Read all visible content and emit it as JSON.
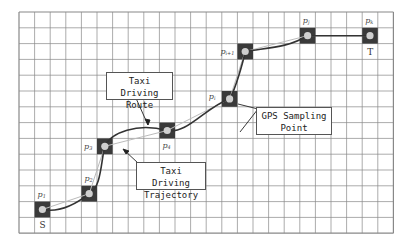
{
  "grid": {
    "left": 19,
    "top": 12,
    "cols": 24,
    "rows": 14,
    "cell_w": 15.6,
    "cell_h": 15.8,
    "line_color": "#888888"
  },
  "colors": {
    "cell_fill": "#3a3a3a",
    "point_fill": "#cfcfcf",
    "route_color": "#333333",
    "trajectory_color": "#bbbbbb"
  },
  "sampling_points": [
    {
      "id": "p1",
      "base": "p",
      "sub": "1",
      "col": 1,
      "row": 12
    },
    {
      "id": "p2",
      "base": "p",
      "sub": "2",
      "col": 4,
      "row": 11
    },
    {
      "id": "p3",
      "base": "p",
      "sub": "3",
      "col": 5,
      "row": 8
    },
    {
      "id": "p4",
      "base": "p",
      "sub": "4",
      "col": 9,
      "row": 7
    },
    {
      "id": "pi",
      "base": "p",
      "sub": "i",
      "col": 13,
      "row": 5
    },
    {
      "id": "pi+1",
      "base": "p",
      "sub": "i+1",
      "col": 14,
      "row": 2
    },
    {
      "id": "pj",
      "base": "p",
      "sub": "j",
      "col": 18,
      "row": 1
    },
    {
      "id": "pk",
      "base": "p",
      "sub": "k",
      "col": 22,
      "row": 1
    }
  ],
  "endpoints": {
    "start": {
      "label": "S",
      "col": 1,
      "row": 13
    },
    "target": {
      "label": "T",
      "col": 22,
      "row": 2
    }
  },
  "callouts": {
    "route": {
      "line1": "Taxi Driving",
      "line2": "Route"
    },
    "gps": {
      "line1": "GPS Sampling",
      "line2": "Point"
    },
    "trajectory": {
      "line1": "Taxi Driving",
      "line2": "Trajectory"
    }
  }
}
